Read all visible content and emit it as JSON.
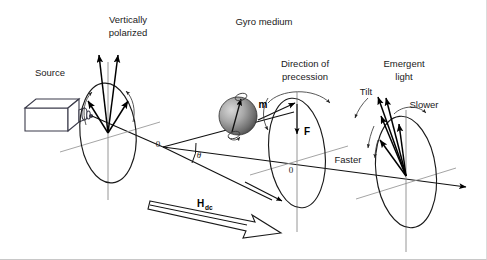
{
  "figure": {
    "kind": "optics-gyromagnetic-faraday-rotation-diagram",
    "width": 487,
    "height": 260,
    "background": "#ffffff",
    "ink": "#1a1a1a"
  },
  "labels": {
    "source": "Source",
    "vertically_polarized_line1": "Vertically",
    "vertically_polarized_line2": "polarized",
    "gyro_medium": "Gyro medium",
    "direction_of_precession_line1": "Direction of",
    "direction_of_precession_line2": "precession",
    "emergent_light_line1": "Emergent",
    "emergent_light_line2": "light",
    "tilt": "Tilt",
    "slower": "Slower",
    "faster": "Faster",
    "m_vector": "m",
    "f_vector": "F",
    "h_dc_main": "H",
    "h_dc_sub": "dc",
    "origin_left": "0",
    "origin_middle": "0",
    "theta": "θ"
  },
  "geometry": {
    "optical_axis": {
      "x1": 60,
      "y1": 118,
      "x2": 470,
      "y2": 186
    },
    "left_ellipse": {
      "cx": 108,
      "cy": 133,
      "rx": 28,
      "ry": 50
    },
    "middle_ellipse": {
      "cx": 297,
      "cy": 153,
      "rx": 28,
      "ry": 55
    },
    "right_ellipse": {
      "cx": 406,
      "cy": 172,
      "rx": 30,
      "ry": 56
    },
    "sphere": {
      "cx": 238,
      "cy": 116,
      "r": 19
    },
    "source_box": {
      "x": 25,
      "y": 100,
      "w": 50,
      "h": 26
    },
    "hdc_arrow": {
      "x1": 152,
      "y1": 205,
      "x2": 275,
      "y2": 235
    },
    "theta_vertex": {
      "x": 163,
      "y": 147
    }
  }
}
